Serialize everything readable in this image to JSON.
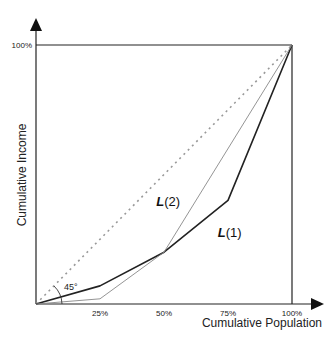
{
  "caption_fragment": "",
  "chart_data": {
    "type": "line",
    "title": "",
    "xlabel": "Cumulative Population",
    "ylabel": "Cumulative Income",
    "xlim": [
      0,
      100
    ],
    "ylim": [
      0,
      100
    ],
    "grid": false,
    "x_ticks": [
      "25%",
      "50%",
      "75%",
      "100%"
    ],
    "y_ticks": [
      "100%"
    ],
    "annotations": [
      "45°"
    ],
    "series": [
      {
        "name": "Line of equality",
        "style": "dotted",
        "color": "#999999",
        "x": [
          0,
          100
        ],
        "y": [
          0,
          100
        ]
      },
      {
        "name": "L(1)",
        "style": "solid-thick",
        "color": "#222222",
        "x": [
          0,
          25,
          50,
          75,
          100
        ],
        "y": [
          0,
          7,
          20,
          40,
          100
        ]
      },
      {
        "name": "L(2)",
        "style": "solid-thin",
        "color": "#888888",
        "x": [
          0,
          25,
          50,
          100
        ],
        "y": [
          0,
          2,
          20,
          100
        ]
      }
    ],
    "labels": [
      {
        "text_main": "L",
        "text_sub": "(2)",
        "x": 47,
        "y": 38
      },
      {
        "text_main": "L",
        "text_sub": "(1)",
        "x": 71,
        "y": 26
      }
    ]
  }
}
